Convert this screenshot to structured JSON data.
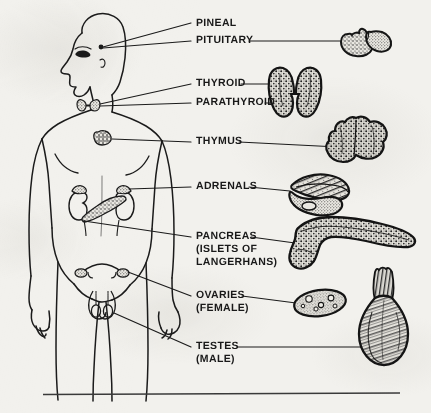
{
  "figure": {
    "background_color": "#f2f1ed",
    "ink_color": "#191919",
    "rule_color": "#3a3a3a"
  },
  "labels": [
    {
      "id": "pineal",
      "lines": [
        "PINEAL"
      ],
      "x": 196,
      "y": 24,
      "leader": true
    },
    {
      "id": "pituitary",
      "lines": [
        "PITUITARY"
      ],
      "x": 196,
      "y": 41,
      "leader": true
    },
    {
      "id": "thyroid",
      "lines": [
        "THYROID"
      ],
      "x": 196,
      "y": 85,
      "leader": true
    },
    {
      "id": "parathyroid",
      "lines": [
        "PARATHYROID"
      ],
      "x": 196,
      "y": 104,
      "leader": true
    },
    {
      "id": "thymus",
      "lines": [
        "THYMUS"
      ],
      "x": 196,
      "y": 143,
      "leader": true
    },
    {
      "id": "adrenals",
      "lines": [
        "ADRENALS"
      ],
      "x": 196,
      "y": 188,
      "leader": true
    },
    {
      "id": "pancreas",
      "lines": [
        "PANCREAS",
        "(ISLETS OF",
        "LANGERHANS)"
      ],
      "x": 196,
      "y": 238,
      "leader": true
    },
    {
      "id": "ovaries",
      "lines": [
        "OVARIES",
        "(FEMALE)"
      ],
      "x": 196,
      "y": 297,
      "leader": true
    },
    {
      "id": "testes",
      "lines": [
        "TESTES",
        "(MALE)"
      ],
      "x": 196,
      "y": 348,
      "leader": true
    }
  ],
  "organ_illustrations": [
    {
      "id": "pituitary-gland",
      "label_ref": "pituitary",
      "cx": 375,
      "cy": 42,
      "description": "two-lobed stippled gland"
    },
    {
      "id": "thyroid-gland",
      "label_ref": "thyroid",
      "cx": 300,
      "cy": 95,
      "description": "butterfly shaped bilobed gland"
    },
    {
      "id": "thymus-gland",
      "label_ref": "thymus",
      "cx": 372,
      "cy": 149,
      "description": "lumpy bilobed mass"
    },
    {
      "id": "adrenal-glands",
      "label_ref": "adrenals",
      "cx": 330,
      "cy": 199,
      "description": "elongated crescent glands atop kidneys"
    },
    {
      "id": "pancreas-organ",
      "label_ref": "pancreas",
      "cx": 350,
      "cy": 243,
      "description": "elongated tapering organ with bulbous head"
    },
    {
      "id": "ovary-organ",
      "label_ref": "ovaries",
      "cx": 320,
      "cy": 305,
      "description": "oval gland with follicles"
    },
    {
      "id": "testis-organ",
      "label_ref": "testes",
      "cx": 383,
      "cy": 322,
      "description": "pear shaped gland with spermatic cord"
    }
  ],
  "body_markers": [
    {
      "id": "pineal-pituitary-site",
      "x": 101,
      "y": 47
    },
    {
      "id": "thyroid-site",
      "x": 88,
      "y": 104
    },
    {
      "id": "thymus-site",
      "x": 105,
      "y": 140
    },
    {
      "id": "adrenal-site",
      "x": 110,
      "y": 196
    },
    {
      "id": "pancreas-site",
      "x": 100,
      "y": 208
    },
    {
      "id": "ovaries-site",
      "x": 122,
      "y": 272
    },
    {
      "id": "testes-site",
      "x": 110,
      "y": 318
    }
  ],
  "footer_rule": {
    "x1": 43,
    "x2": 400,
    "y": 394
  }
}
